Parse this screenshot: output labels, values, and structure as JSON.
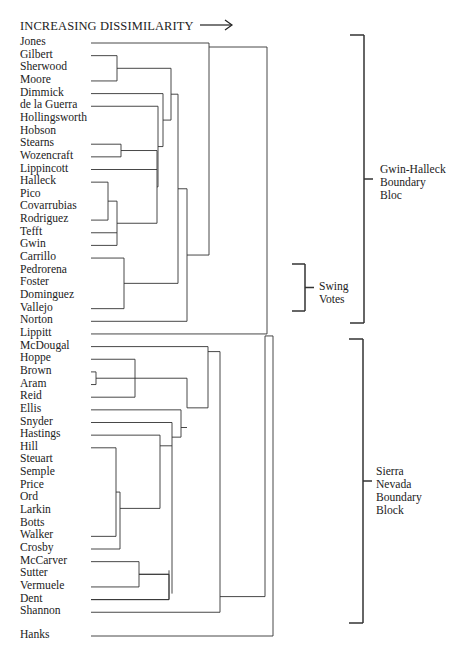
{
  "header": {
    "title": "INCREASING DISSIMILARITY",
    "arrow": "→"
  },
  "leaves": [
    "Jones",
    "Gilbert",
    "Sherwood",
    "Moore",
    "Dimmick",
    "de la Guerra",
    "Hollingsworth",
    "Hobson",
    "Stearns",
    "Wozencraft",
    "Lippincott",
    "Halleck",
    "Pico",
    "Covarrubias",
    "Rodriguez",
    "Tefft",
    "Gwin",
    "Carrillo",
    "Pedrorena",
    "Foster",
    "Dominguez",
    "Vallejo",
    "Norton",
    "Lippitt",
    "McDougal",
    "Hoppe",
    "Brown",
    "Aram",
    "Reid",
    "Ellis",
    "Snyder",
    "Hastings",
    "Hill",
    "Steuart",
    "Semple",
    "Price",
    "Ord",
    "Larkin",
    "Botts",
    "Walker",
    "Crosby",
    "McCarver",
    "Sutter",
    "Vermuele",
    "Dent",
    "Shannon",
    "Hanks"
  ],
  "groups": [
    {
      "name": "gwin-halleck-bloc",
      "lines": [
        "Gwin-Halleck",
        "Boundary",
        "Bloc"
      ]
    },
    {
      "name": "swing-votes",
      "lines": [
        "Swing",
        "Votes"
      ]
    },
    {
      "name": "sierra-nevada-block",
      "lines": [
        "Sierra",
        "Nevada",
        "Boundary",
        "Block"
      ]
    }
  ],
  "chart_data": {
    "type": "dendrogram",
    "title": "INCREASING DISSIMILARITY",
    "orientation": "horizontal, leaves on left, merges increase to the right",
    "leaves": [
      "Jones",
      "Gilbert",
      "Sherwood",
      "Moore",
      "Dimmick",
      "de la Guerra",
      "Hollingsworth",
      "Hobson",
      "Stearns",
      "Wozencraft",
      "Lippincott",
      "Halleck",
      "Pico",
      "Covarrubias",
      "Rodriguez",
      "Tefft",
      "Gwin",
      "Carrillo",
      "Pedrorena",
      "Foster",
      "Dominguez",
      "Vallejo",
      "Norton",
      "Lippitt",
      "McDougal",
      "Hoppe",
      "Brown",
      "Aram",
      "Reid",
      "Ellis",
      "Snyder",
      "Hastings",
      "Hill",
      "Steuart",
      "Semple",
      "Price",
      "Ord",
      "Larkin",
      "Botts",
      "Walker",
      "Crosby",
      "McCarver",
      "Sutter",
      "Vermuele",
      "Dent",
      "Shannon",
      "Hanks"
    ],
    "groups": [
      {
        "label": "Gwin-Halleck Boundary Bloc",
        "members_from": "Jones",
        "members_to": "Norton"
      },
      {
        "label": "Swing Votes",
        "members_from": "Carrillo",
        "members_to": "Vallejo"
      },
      {
        "label": "Sierra Nevada Boundary Block",
        "members_from": "McDougal",
        "members_to": "Shannon"
      }
    ]
  }
}
